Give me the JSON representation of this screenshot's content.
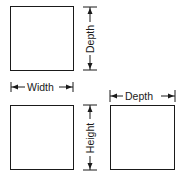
{
  "diagram": {
    "title": "",
    "colors": {
      "line": "#1a1a1a",
      "background": "#ffffff"
    },
    "views": [
      {
        "id": "top-view",
        "dimension": {
          "label": "Depth",
          "orientation": "vertical",
          "side": "right"
        }
      },
      {
        "id": "front-view",
        "dimension": {
          "label": "Width",
          "orientation": "horizontal",
          "side": "top"
        }
      },
      {
        "id": "front-view-height",
        "dimension": {
          "label": "Height",
          "orientation": "vertical",
          "side": "right"
        }
      },
      {
        "id": "side-view",
        "dimension": {
          "label": "Depth",
          "orientation": "horizontal",
          "side": "top"
        }
      }
    ]
  }
}
